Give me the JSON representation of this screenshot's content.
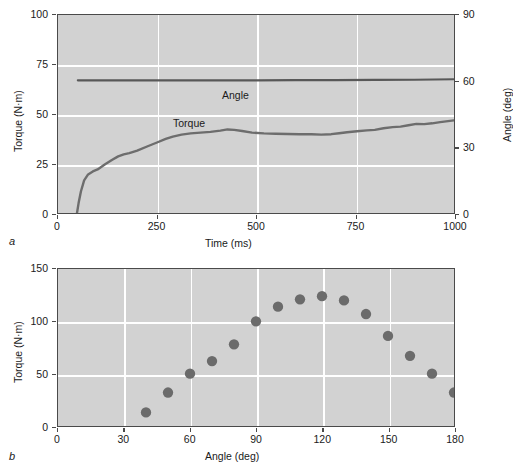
{
  "figure": {
    "panel_a_letter": "a",
    "panel_b_letter": "b"
  },
  "chart_data": [
    {
      "type": "line",
      "panel": "a",
      "title": "",
      "xlabel": "Time (ms)",
      "ylabel": "Torque (N·m)",
      "y2label": "Angle (deg)",
      "xlim": [
        0,
        1000
      ],
      "ylim": [
        0,
        100
      ],
      "y2lim": [
        0,
        90
      ],
      "xticks": [
        0,
        250,
        500,
        750,
        1000
      ],
      "xticklabels": [
        "0",
        "250",
        "500",
        "750",
        "1000"
      ],
      "yticks": [
        0,
        25,
        50,
        75,
        100
      ],
      "yticklabels": [
        "0",
        "25",
        "50",
        "75",
        "100"
      ],
      "y2ticks": [
        0,
        30,
        60,
        90
      ],
      "y2ticklabels": [
        "0",
        "30",
        "60",
        "90"
      ],
      "grid": true,
      "grid_color": "#ffffff",
      "plot_bg": "#d2d2d2",
      "line_color": "#585858",
      "annotations": [
        {
          "text": "Angle",
          "x": 560,
          "y": 58
        },
        {
          "text": "Torque",
          "x": 400,
          "y": 46
        }
      ],
      "series": [
        {
          "name": "Angle",
          "axis": "right",
          "x": [
            50,
            100,
            200,
            300,
            400,
            500,
            600,
            700,
            800,
            900,
            1000
          ],
          "values": [
            60.3,
            60.3,
            60.3,
            60.3,
            60.3,
            60.3,
            60.4,
            60.4,
            60.5,
            60.6,
            60.8
          ]
        },
        {
          "name": "Torque",
          "axis": "left",
          "x": [
            48,
            52,
            58,
            66,
            76,
            88,
            100,
            118,
            136,
            152,
            166,
            180,
            200,
            225,
            250,
            272,
            290,
            312,
            335,
            360,
            385,
            410,
            428,
            445,
            465,
            490,
            520,
            550,
            580,
            610,
            640,
            665,
            690,
            710,
            730,
            755,
            780,
            800,
            822,
            845,
            865,
            885,
            905,
            925,
            945,
            965,
            985,
            1000
          ],
          "values": [
            0.0,
            5.0,
            11.0,
            16.5,
            19.5,
            21.0,
            22.0,
            24.5,
            26.8,
            28.6,
            29.6,
            30.2,
            31.5,
            33.6,
            35.6,
            37.4,
            38.6,
            39.6,
            40.2,
            40.6,
            41.0,
            41.6,
            42.2,
            42.0,
            41.4,
            40.6,
            40.2,
            40.0,
            39.9,
            39.8,
            39.8,
            39.6,
            39.8,
            40.3,
            40.8,
            41.3,
            41.7,
            42.0,
            42.8,
            43.4,
            43.6,
            44.3,
            45.0,
            44.9,
            45.3,
            45.9,
            46.4,
            46.8
          ]
        }
      ]
    },
    {
      "type": "scatter",
      "panel": "b",
      "title": "",
      "xlabel": "Angle (deg)",
      "ylabel": "Torque (N·m)",
      "xlim": [
        0,
        180
      ],
      "ylim": [
        0,
        150
      ],
      "xticks": [
        0,
        30,
        60,
        90,
        120,
        150,
        180
      ],
      "xticklabels": [
        "0",
        "30",
        "60",
        "90",
        "120",
        "150",
        "180"
      ],
      "yticks": [
        0,
        50,
        100,
        150
      ],
      "yticklabels": [
        "0",
        "50",
        "100",
        "150"
      ],
      "grid": true,
      "grid_color": "#ffffff",
      "plot_bg": "#d2d2d2",
      "marker_color": "#6b6b6b",
      "marker_size": 5.2,
      "x": [
        40,
        50,
        60,
        70,
        80,
        90,
        100,
        110,
        120,
        130,
        140,
        150,
        160,
        170,
        180
      ],
      "values": [
        13,
        32,
        50,
        62,
        78,
        100,
        114,
        121,
        124,
        120,
        107,
        86,
        67,
        50,
        32
      ]
    }
  ]
}
